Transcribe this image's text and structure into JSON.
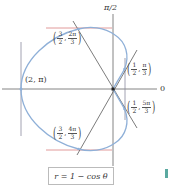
{
  "figure": {
    "equation": "r = 1 − cos θ",
    "axis_labels": {
      "top": "π/2",
      "right": "0"
    },
    "points": [
      {
        "id": "pi",
        "label": "(2, π)"
      },
      {
        "id": "2pi3",
        "r_num": "3",
        "r_den": "2",
        "t_num": "2π",
        "t_den": "3"
      },
      {
        "id": "pi3",
        "r_num": "1",
        "r_den": "2",
        "t_num": "π",
        "t_den": "3"
      },
      {
        "id": "5pi3",
        "r_num": "1",
        "r_den": "2",
        "t_num": "5π",
        "t_den": "3"
      },
      {
        "id": "4pi3",
        "r_num": "3",
        "r_den": "2",
        "t_num": "4π",
        "t_den": "3"
      }
    ],
    "colors": {
      "curve": "#8fb0d8",
      "tangent_red": "#d98080",
      "axis": "#555555",
      "pole_lines": "#444444",
      "accent": "#5aa9a0"
    }
  }
}
